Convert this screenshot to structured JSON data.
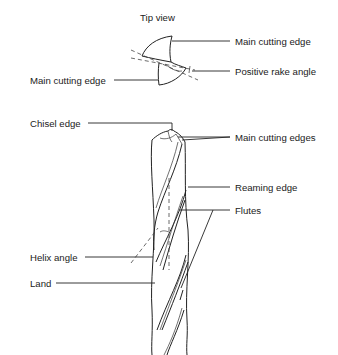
{
  "diagram": {
    "title": "Tip view",
    "tip_view": {
      "labels": {
        "main_cutting_edge_right": "Main cutting edge",
        "main_cutting_edge_left": "Main cutting edge",
        "positive_rake_angle": "Positive rake angle"
      }
    },
    "drill_side_view": {
      "labels": {
        "chisel_edge": "Chisel edge",
        "main_cutting_edges": "Main cutting edges",
        "reaming_edge": "Reaming edge",
        "flutes": "Flutes",
        "helix_angle": "Helix angle",
        "land": "Land"
      }
    },
    "colors": {
      "line": "#222222",
      "background": "#ffffff"
    }
  }
}
